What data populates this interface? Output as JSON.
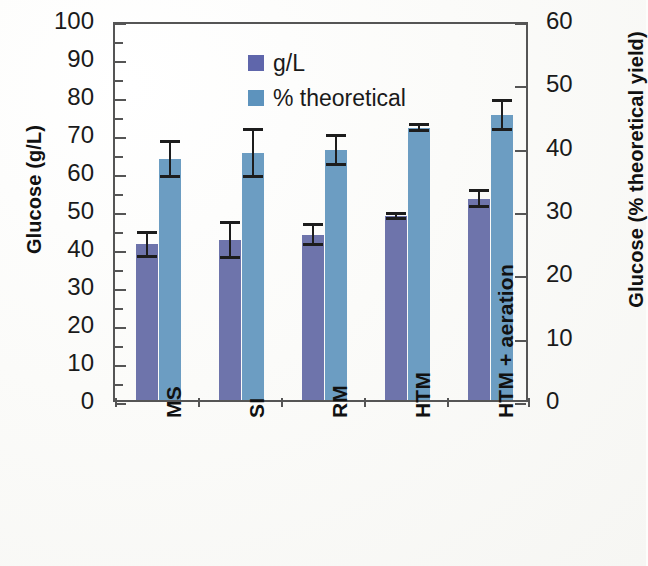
{
  "chart_data": {
    "type": "bar",
    "title": "",
    "subtitle": "",
    "categories": [
      "MS",
      "SI",
      "RM",
      "HTM",
      "HTM + aeration"
    ],
    "series": [
      {
        "name": "g/L",
        "axis": "left",
        "color": "#6e74ab",
        "values": [
          41,
          42,
          43.5,
          48.5,
          53
        ],
        "errors": [
          3.5,
          5,
          3,
          1,
          2.5
        ]
      },
      {
        "name": "% theoretical",
        "axis": "right",
        "color": "#6c9dc2",
        "values": [
          38,
          39,
          39.5,
          43,
          45
        ],
        "values_on_left_scale": [
          63.5,
          65,
          66,
          71.5,
          75.5
        ],
        "errors": [
          3,
          4,
          2.5,
          0.7,
          2.5
        ]
      }
    ],
    "xlabel": "",
    "ylabel": "Glucose (g/L)",
    "ylabel_right": "Glucose (% theoretical yield)",
    "ylim": [
      0,
      100
    ],
    "ylim_right": [
      0,
      60
    ],
    "ytick_step": 10,
    "ytick_step_right": 10,
    "grid": false,
    "legend_position": "top-left"
  },
  "axes": {
    "left": {
      "title": "Glucose (g/L)",
      "ticks": [
        "100",
        "90",
        "80",
        "70",
        "60",
        "50",
        "40",
        "30",
        "20",
        "10",
        "0"
      ]
    },
    "right": {
      "title": "Glucose (% theoretical yield)",
      "ticks": [
        "60",
        "50",
        "40",
        "30",
        "20",
        "10",
        "0"
      ]
    },
    "x": {
      "categories": [
        "MS",
        "SI",
        "RM",
        "HTM",
        "HTM + aeration"
      ]
    }
  },
  "legend": {
    "items": [
      {
        "label": "g/L",
        "color": "#5f66ab"
      },
      {
        "label": "% theoretical",
        "color": "#5d93bd"
      }
    ]
  },
  "colors": {
    "series_gl": "#6e74ab",
    "series_pct": "#6c9dc2",
    "axis": "#555555",
    "error_bar": "#1d1d1d",
    "text": "#111111",
    "background": "#fdfdfb"
  }
}
